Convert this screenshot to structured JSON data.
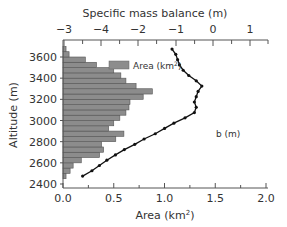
{
  "chart_data": {
    "type": "bar",
    "title": "",
    "top_axis": {
      "label": "Specific mass balance (m)",
      "tick_labels": [
        "-3",
        "-4",
        "-2",
        "-1",
        "0",
        "1"
      ],
      "range": [
        -3,
        1.5
      ]
    },
    "xlabel": "Area (km²)",
    "ylabel": "Altitude (m)",
    "xlim": [
      0,
      2.0
    ],
    "ylim": [
      2400,
      3750
    ],
    "x_ticks": [
      "0.0",
      "0.5",
      "1.0",
      "1.5",
      "2.0"
    ],
    "y_ticks": [
      "2400",
      "2600",
      "2800",
      "3000",
      "3200",
      "3400",
      "3600"
    ],
    "legend": {
      "label": "Area (km",
      "sup": "2",
      "close": ")"
    },
    "line_label": "b (m)",
    "series": [
      {
        "name": "Area (km²)",
        "kind": "horizontal-bar",
        "altitudes": [
          2475,
          2525,
          2575,
          2625,
          2675,
          2725,
          2775,
          2825,
          2875,
          2925,
          2975,
          3025,
          3075,
          3125,
          3175,
          3225,
          3275,
          3325,
          3375,
          3425,
          3475,
          3525,
          3575,
          3625,
          3675
        ],
        "values": [
          0.03,
          0.07,
          0.1,
          0.18,
          0.36,
          0.4,
          0.38,
          0.52,
          0.6,
          0.45,
          0.5,
          0.56,
          0.62,
          0.65,
          0.66,
          0.79,
          0.88,
          0.72,
          0.62,
          0.57,
          0.5,
          0.33,
          0.22,
          0.06,
          0.03
        ]
      },
      {
        "name": "b (m)",
        "kind": "line",
        "altitudes": [
          2475,
          2525,
          2575,
          2625,
          2675,
          2725,
          2775,
          2825,
          2875,
          2925,
          2975,
          3025,
          3075,
          3125,
          3175,
          3225,
          3275,
          3325,
          3375,
          3425,
          3475,
          3525,
          3575,
          3625,
          3675
        ],
        "values": [
          -2.5,
          -2.25,
          -2.05,
          -1.85,
          -1.62,
          -1.38,
          -1.1,
          -0.85,
          -0.55,
          -0.3,
          -0.05,
          0.25,
          0.5,
          0.55,
          0.5,
          0.55,
          0.6,
          0.7,
          0.55,
          0.35,
          0.2,
          0.1,
          0.05,
          0.0,
          -0.1
        ]
      }
    ]
  }
}
